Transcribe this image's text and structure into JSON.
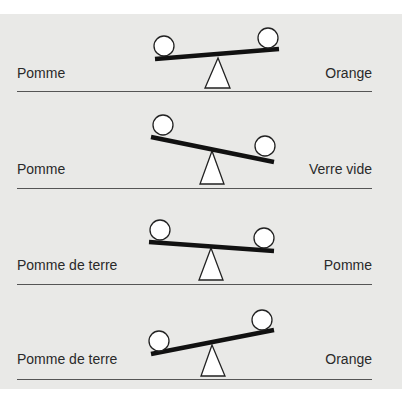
{
  "diagram": {
    "rows": [
      {
        "left_label": "Pomme",
        "right_label": "Orange",
        "tilt": "left-down",
        "beam": [
          155,
          59,
          279,
          49
        ],
        "left_ball": [
          164,
          46
        ],
        "right_ball": [
          268,
          38
        ],
        "fulcrum": [
          218,
          58,
          205,
          88,
          230,
          88
        ],
        "label_y": 64,
        "divider_y": 91
      },
      {
        "left_label": "Pomme",
        "right_label": "Verre vide",
        "tilt": "right-down",
        "beam": [
          151,
          137,
          274,
          162
        ],
        "left_ball": [
          163,
          125
        ],
        "right_ball": [
          265,
          146
        ],
        "fulcrum": [
          212,
          151,
          200,
          184,
          224,
          184
        ],
        "label_y": 161,
        "divider_y": 188
      },
      {
        "left_label": "Pomme de terre",
        "right_label": "Pomme",
        "tilt": "right-down",
        "beam": [
          149,
          242,
          274,
          251
        ],
        "left_ball": [
          160,
          230
        ],
        "right_ball": [
          264,
          238
        ],
        "fulcrum": [
          211,
          248,
          199,
          280,
          223,
          280
        ],
        "label_y": 256,
        "divider_y": 284
      },
      {
        "left_label": "Pomme de terre",
        "right_label": "Orange",
        "tilt": "left-down",
        "beam": [
          151,
          354,
          274,
          330
        ],
        "left_ball": [
          159,
          341
        ],
        "right_ball": [
          262,
          320
        ],
        "fulcrum": [
          212,
          345,
          201,
          376,
          225,
          376
        ],
        "label_y": 350,
        "divider_y": 379
      }
    ],
    "colors": {
      "panel": "#e9e9e7",
      "beam": "#111111",
      "ball_fill": "#ffffff",
      "ball_stroke": "#222222",
      "divider": "#555555",
      "text": "#2a2a2a"
    },
    "ball_radius": 10
  }
}
